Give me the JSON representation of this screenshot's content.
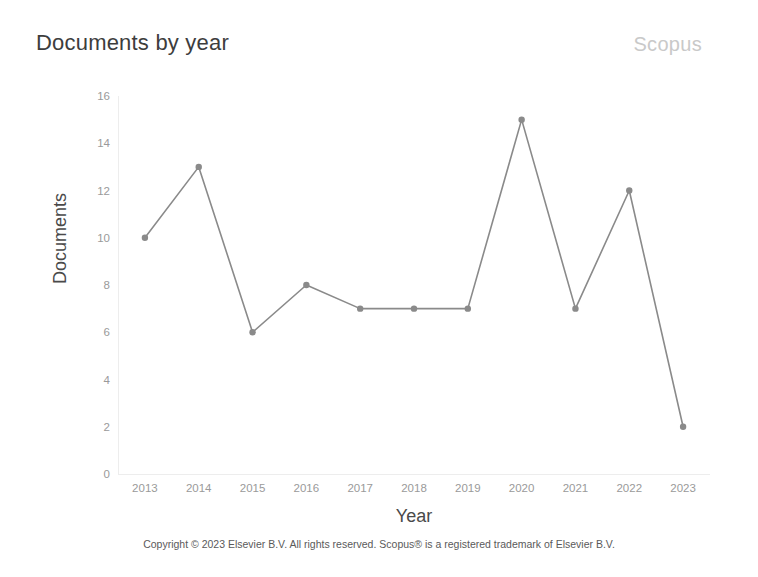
{
  "header": {
    "title": "Documents by year",
    "brand": "Scopus"
  },
  "footer": {
    "copyright": "Copyright © 2023 Elsevier B.V. All rights reserved. Scopus® is a registered trademark of Elsevier B.V."
  },
  "colors": {
    "line": "#8a8a8a",
    "marker": "#8a8a8a",
    "axis": "#ededed",
    "tick_text": "#9a9a9a",
    "title": "#3d3d3d",
    "brand": "#c9c9c9",
    "background": "#ffffff"
  },
  "chart_data": {
    "type": "line",
    "title": "Documents by year",
    "xlabel": "Year",
    "ylabel": "Documents",
    "categories": [
      "2013",
      "2014",
      "2015",
      "2016",
      "2017",
      "2018",
      "2019",
      "2020",
      "2021",
      "2022",
      "2023"
    ],
    "values": [
      10,
      13,
      6,
      8,
      7,
      7,
      7,
      15,
      7,
      12,
      2
    ],
    "series": [
      {
        "name": "Documents",
        "values": [
          10,
          13,
          6,
          8,
          7,
          7,
          7,
          15,
          7,
          12,
          2
        ]
      }
    ],
    "ylim": [
      0,
      16
    ],
    "ytick_labels": [
      "0",
      "2",
      "4",
      "6",
      "8",
      "10",
      "12",
      "14",
      "16"
    ],
    "ytick_values": [
      0,
      2,
      4,
      6,
      8,
      10,
      12,
      14,
      16
    ],
    "xtick_labels": [
      "2013",
      "2014",
      "2015",
      "2016",
      "2017",
      "2018",
      "2019",
      "2020",
      "2021",
      "2022",
      "2023"
    ],
    "grid": false,
    "legend": "none",
    "marker": "circle"
  }
}
